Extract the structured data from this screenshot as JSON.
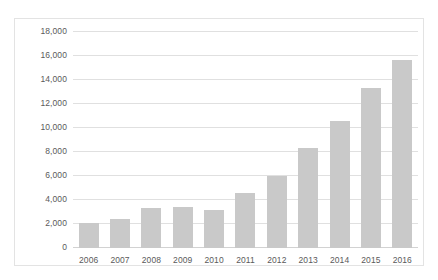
{
  "chart_data": {
    "type": "bar",
    "title": "",
    "subtitle": "",
    "xlabel": "",
    "ylabel": "",
    "categories": [
      "2006",
      "2007",
      "2008",
      "2009",
      "2010",
      "2011",
      "2012",
      "2013",
      "2014",
      "2015",
      "2016"
    ],
    "values": [
      2100,
      2450,
      3350,
      3400,
      3200,
      4600,
      6000,
      8300,
      10600,
      13300,
      15700
    ],
    "series": [
      {
        "name": "",
        "values": [
          2100,
          2450,
          3350,
          3400,
          3200,
          4600,
          6000,
          8300,
          10600,
          13300,
          15700
        ]
      }
    ],
    "ylim": [
      0,
      18000
    ],
    "ytick_values": [
      0,
      2000,
      4000,
      6000,
      8000,
      10000,
      12000,
      14000,
      16000,
      18000
    ],
    "ytick_labels": [
      "0",
      "2,000",
      "4,000",
      "6,000",
      "8,000",
      "10,000",
      "12,000",
      "14,000",
      "16,000",
      "18,000"
    ],
    "grid": true,
    "grid_axis": "y",
    "legend": false,
    "legend_position": "none",
    "bar_color": "#c9c9c9",
    "grid_color": "#e0e0e0",
    "axis_text_color": "#5a5a5a",
    "frame_color": "#e3e3e3",
    "background": "#ffffff"
  }
}
